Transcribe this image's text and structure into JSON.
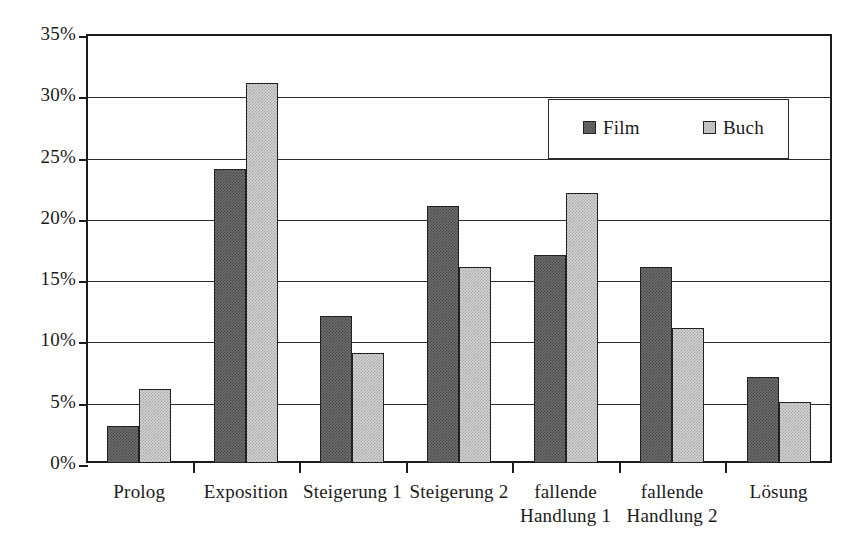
{
  "chart_data": {
    "type": "bar",
    "title": "",
    "subtitle": "",
    "xlabel": "",
    "ylabel": "",
    "categories": [
      "Prolog",
      "Exposition",
      "Steigerung 1",
      "Steigerung 2",
      "fallende\nHandlung 1",
      "fallende\nHandlung 2",
      "Lösung"
    ],
    "series": [
      {
        "name": "Film",
        "values": [
          3,
          24,
          12,
          21,
          17,
          16,
          7
        ],
        "color": "#6e6e6e"
      },
      {
        "name": "Buch",
        "values": [
          6,
          31,
          9,
          16,
          22,
          11,
          5
        ],
        "color": "#d2d2d2"
      }
    ],
    "ylim": [
      0,
      35
    ],
    "ytick_values": [
      0,
      5,
      10,
      15,
      20,
      25,
      30,
      35
    ],
    "ytick_labels": [
      "0%",
      "5%",
      "10%",
      "15%",
      "20%",
      "25%",
      "30%",
      "35%"
    ],
    "value_unit": "%",
    "grid": true,
    "legend_position": "top-right-inside",
    "legend_entries": [
      "Film",
      "Buch"
    ]
  },
  "style": {
    "background": "#ffffff",
    "axis_color": "#1c1c1c",
    "grid_color": "#2b2b2b",
    "text_color": "#1a1a1a"
  }
}
